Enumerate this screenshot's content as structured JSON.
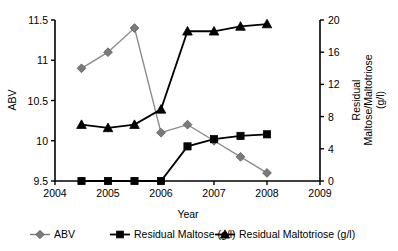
{
  "chart_data": {
    "type": "line",
    "title": "",
    "xlabel": "Year",
    "ylabel": "ABV",
    "y2label": "Residual Maltose/Maltotriose (g/l)",
    "y2label_line1": "Residual",
    "y2label_line2": "Maltose/Maltotriose",
    "y2label_line3": "(g/l)",
    "xlim": [
      2004,
      2009
    ],
    "ylim": [
      9.5,
      11.5
    ],
    "y2lim": [
      0,
      20
    ],
    "grid": false,
    "legend_position": "bottom",
    "x_ticks": [
      "2004",
      "2005",
      "2006",
      "2007",
      "2008",
      "2009"
    ],
    "x_tick_values": [
      2004,
      2005,
      2006,
      2007,
      2008,
      2009
    ],
    "y_ticks": [
      "9.5",
      "10",
      "10.5",
      "11",
      "11.5"
    ],
    "y_tick_values": [
      9.5,
      10,
      10.5,
      11,
      11.5
    ],
    "y2_ticks": [
      "0",
      "4",
      "8",
      "12",
      "16",
      "20"
    ],
    "y2_tick_values": [
      0,
      4,
      8,
      12,
      16,
      20
    ],
    "x": [
      2004.5,
      2005,
      2005.5,
      2006,
      2006.5,
      2007,
      2007.5,
      2008
    ],
    "series": [
      {
        "name": "ABV",
        "axis": "left",
        "marker": "diamond",
        "color": "#7a7a7a",
        "line_color": "#8c8c8c",
        "values": [
          10.9,
          11.1,
          11.4,
          10.1,
          10.2,
          10.0,
          9.8,
          9.6
        ]
      },
      {
        "name": "Residual Maltose (g/l)",
        "axis": "right",
        "marker": "square",
        "color": "#000000",
        "line_color": "#000000",
        "values": [
          0,
          0,
          0,
          0,
          4.3,
          5.2,
          5.6,
          5.8
        ]
      },
      {
        "name": "Residual Maltotriose (g/l)",
        "axis": "right",
        "marker": "triangle",
        "color": "#000000",
        "line_color": "#000000",
        "values": [
          7.0,
          6.6,
          7.0,
          8.9,
          18.6,
          18.6,
          19.2,
          19.5
        ]
      }
    ]
  },
  "legend": {
    "items": [
      {
        "label": "ABV",
        "marker": "diamond",
        "color": "#7a7a7a"
      },
      {
        "label": "Residual Maltose (g/l)",
        "marker": "square",
        "color": "#000000"
      },
      {
        "label": "Residual Maltotriose (g/l)",
        "marker": "triangle",
        "color": "#000000"
      }
    ]
  }
}
